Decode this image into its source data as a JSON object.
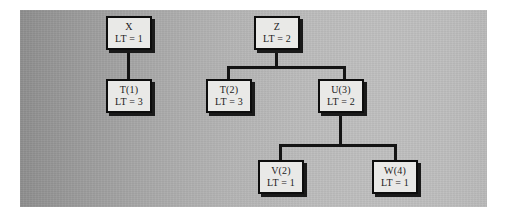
{
  "diagram": {
    "type": "tree",
    "background_color": "#b0b0b0",
    "node_fill_color": "#e9e9e7",
    "node_border_color": "#0d0d0d",
    "edge_color": "#141414",
    "label_prefix": "LT",
    "nodes": [
      {
        "id": "x",
        "name": "X",
        "lt_text": "LT = 1",
        "lt_value": 1,
        "x": 106,
        "y": 16,
        "w": 46,
        "h": 34
      },
      {
        "id": "t1",
        "name": "T(1)",
        "lt_text": "LT = 3",
        "lt_value": 3,
        "x": 106,
        "y": 79,
        "w": 46,
        "h": 34
      },
      {
        "id": "z",
        "name": "Z",
        "lt_text": "LT = 2",
        "lt_value": 2,
        "x": 254,
        "y": 16,
        "w": 46,
        "h": 34
      },
      {
        "id": "t2",
        "name": "T(2)",
        "lt_text": "LT = 3",
        "lt_value": 3,
        "x": 206,
        "y": 79,
        "w": 46,
        "h": 34
      },
      {
        "id": "u3",
        "name": "U(3)",
        "lt_text": "LT = 2",
        "lt_value": 2,
        "x": 300,
        "y": 79,
        "w": 46,
        "h": 34
      },
      {
        "id": "v2",
        "name": "V(2)",
        "lt_text": "LT = 1",
        "lt_value": 1,
        "x": 258,
        "y": 160,
        "w": 46,
        "h": 34
      },
      {
        "id": "w4",
        "name": "W(4)",
        "lt_text": "LT = 1",
        "lt_value": 1,
        "x": 352,
        "y": 160,
        "w": 46,
        "h": 34
      }
    ],
    "edges": [
      {
        "from": "x",
        "to": "t1"
      },
      {
        "from": "z",
        "to": "t2"
      },
      {
        "from": "z",
        "to": "u3"
      },
      {
        "from": "u3",
        "to": "v2"
      },
      {
        "from": "u3",
        "to": "w4"
      }
    ]
  }
}
